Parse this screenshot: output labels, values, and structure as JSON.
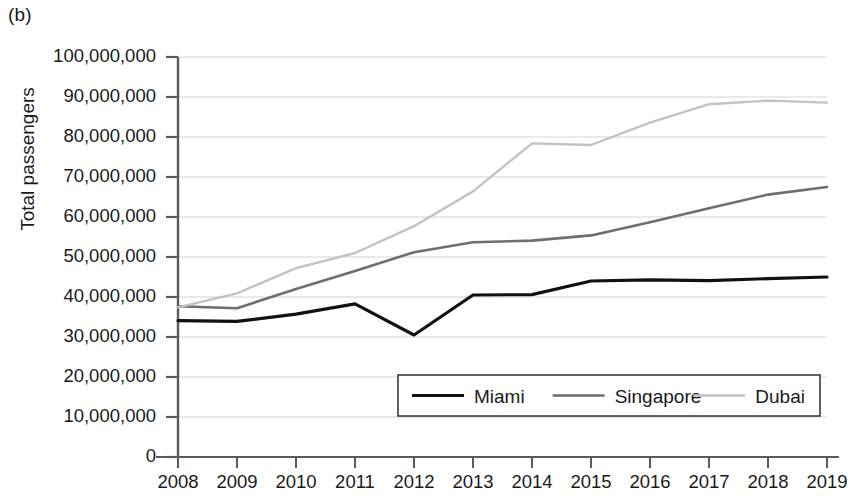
{
  "panel_label": "(b)",
  "axes": {
    "y_title": "Total passengers",
    "y_ticks": [
      "0",
      "10,000,000",
      "20,000,000",
      "30,000,000",
      "40,000,000",
      "50,000,000",
      "60,000,000",
      "70,000,000",
      "80,000,000",
      "90,000,000",
      "100,000,000"
    ],
    "x_ticks": [
      "2008",
      "2009",
      "2010",
      "2011",
      "2012",
      "2013",
      "2014",
      "2015",
      "2016",
      "2017",
      "2018",
      "2019"
    ]
  },
  "legend": {
    "items": [
      {
        "label": "Miami",
        "color": "#111111"
      },
      {
        "label": "Singapore",
        "color": "#6e6e6e"
      },
      {
        "label": "Dubai",
        "color": "#c2c2c2"
      }
    ]
  },
  "chart_data": {
    "type": "line",
    "title": "",
    "subtitle": "",
    "xlabel": "",
    "ylabel": "Total passengers",
    "x": [
      2008,
      2009,
      2010,
      2011,
      2012,
      2013,
      2014,
      2015,
      2016,
      2017,
      2018,
      2019
    ],
    "categories": [
      "2008",
      "2009",
      "2010",
      "2011",
      "2012",
      "2013",
      "2014",
      "2015",
      "2016",
      "2017",
      "2018",
      "2019"
    ],
    "xlim": [
      2008,
      2019
    ],
    "ylim": [
      0,
      100000000
    ],
    "ytick_step": 10000000,
    "grid": true,
    "grid_axis": "y",
    "legend_position": "bottom-center",
    "series": [
      {
        "name": "Miami",
        "color": "#111111",
        "line_width": 3.2,
        "values": [
          34100000,
          33900000,
          35700000,
          38300000,
          30500000,
          40500000,
          40600000,
          44000000,
          44300000,
          44100000,
          44600000,
          45000000
        ]
      },
      {
        "name": "Singapore",
        "color": "#6e6e6e",
        "line_width": 2.6,
        "values": [
          37700000,
          37200000,
          42000000,
          46500000,
          51200000,
          53700000,
          54100000,
          55400000,
          58700000,
          62200000,
          65600000,
          67500000
        ]
      },
      {
        "name": "Dubai",
        "color": "#c2c2c2",
        "line_width": 2.4,
        "values": [
          37400000,
          40900000,
          47200000,
          51000000,
          57700000,
          66400000,
          78400000,
          78000000,
          83600000,
          88200000,
          89100000,
          88600000
        ]
      }
    ]
  },
  "geometry": {
    "plot_left": 178,
    "plot_right": 827,
    "plot_top": 57,
    "plot_bottom": 457
  }
}
